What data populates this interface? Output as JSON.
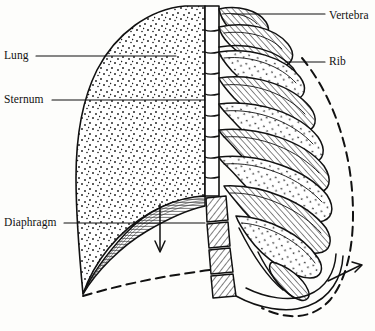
{
  "figure": {
    "type": "anatomical-line-diagram",
    "background_color": "#fdfdfb",
    "ink_color": "#111111"
  },
  "labels": {
    "lung": "Lung",
    "sternum": "Sternum",
    "diaphragm": "Diaphragm",
    "vertebra": "Vertebra",
    "rib": "Rib"
  },
  "leaders": {
    "lung": {
      "x1": 36,
      "y1": 56,
      "x2": 176,
      "y2": 56
    },
    "sternum": {
      "x1": 52,
      "y1": 100,
      "x2": 205,
      "y2": 100
    },
    "diaphragm": {
      "x1": 64,
      "y1": 223,
      "x2": 205,
      "y2": 223
    },
    "vertebra": {
      "x1": 232,
      "y1": 14,
      "x2": 325,
      "y2": 14
    },
    "rib": {
      "x1": 285,
      "y1": 62,
      "x2": 325,
      "y2": 62
    }
  },
  "annotations": {
    "down_arrow": {
      "name": "diaphragm-descent-arrow",
      "x": 160,
      "y1": 205,
      "y2": 252,
      "direction": "down"
    },
    "out_arrow": {
      "name": "ribcage-expansion-arrow",
      "x1": 330,
      "y1": 280,
      "x2": 360,
      "y2": 266,
      "direction": "up-right"
    },
    "dashed_diaphragm": "lowered diaphragm position",
    "dashed_ribcage": "expanded ribcage position"
  },
  "structures": {
    "lung_fill": "stipple",
    "rib_fill": "hatch-and-stipple",
    "vertebra_fill": "hatch",
    "diaphragm_fill": "fine-parallel-lines",
    "rib_count": 10,
    "vertebra_count": 12
  }
}
